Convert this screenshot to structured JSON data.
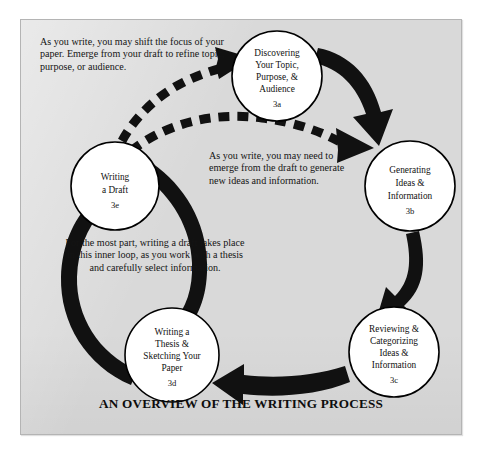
{
  "figure": {
    "caption": "AN OVERVIEW OF THE WRITING PROCESS",
    "panel_background": "#d9d9d9",
    "ink_color": "#111111",
    "node_fill": "#ffffff"
  },
  "nodes": [
    {
      "id": "3a",
      "code": "3a",
      "lines": [
        "Discovering",
        "Your Topic,",
        "Purpose, &",
        "Audience"
      ],
      "cx": 277,
      "cy": 76,
      "r": 45
    },
    {
      "id": "3b",
      "code": "3b",
      "lines": [
        "Generating",
        "Ideas &",
        "Information"
      ],
      "cx": 410,
      "cy": 186,
      "r": 45
    },
    {
      "id": "3c",
      "code": "3c",
      "lines": [
        "Reviewing &",
        "Categorizing",
        "Ideas &",
        "Information"
      ],
      "cx": 394,
      "cy": 352,
      "r": 45
    },
    {
      "id": "3d",
      "code": "3d",
      "lines": [
        "Writing a",
        "Thesis &",
        "Sketching Your",
        "Paper"
      ],
      "cx": 172,
      "cy": 355,
      "r": 47
    },
    {
      "id": "3e",
      "code": "3e",
      "lines": [
        "Writing",
        "a Draft"
      ],
      "cx": 115,
      "cy": 186,
      "r": 44
    }
  ],
  "annotations": [
    {
      "id": "annot-shift",
      "text": "As you write, you may shift the focus of your paper. Emerge from your draft to refine topic, purpose, or audience."
    },
    {
      "id": "annot-emerge",
      "text": "As you write, you may need to emerge from the draft to generate new ideas and information."
    },
    {
      "id": "annot-inner",
      "text": "For the most part, writing a draft takes place in this inner loop, as you work with a thesis and carefully select information."
    }
  ],
  "flows": [
    {
      "id": "flow-3a-to-3b",
      "from": "3a",
      "to": "3b",
      "style": "solid",
      "label": ""
    },
    {
      "id": "flow-3b-to-3c",
      "from": "3b",
      "to": "3c",
      "style": "solid",
      "label": ""
    },
    {
      "id": "flow-3c-to-3d",
      "from": "3c",
      "to": "3d",
      "style": "solid",
      "label": ""
    },
    {
      "id": "flow-3d-to-3e",
      "from": "3d",
      "to": "3e",
      "style": "solid",
      "label": ""
    },
    {
      "id": "flow-3e-to-3d-inner",
      "from": "3e",
      "to": "3d",
      "style": "solid",
      "label": ""
    },
    {
      "id": "flow-3e-to-3a-dashed",
      "from": "3e",
      "to": "3a",
      "style": "dashed",
      "label": ""
    },
    {
      "id": "flow-3e-to-3b-dashed",
      "from": "3e",
      "to": "3b",
      "style": "dashed",
      "label": ""
    }
  ]
}
